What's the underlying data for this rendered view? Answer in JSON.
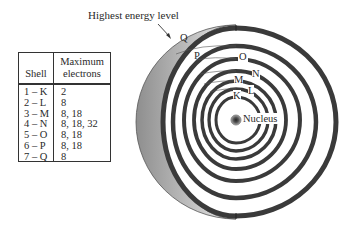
{
  "figure": {
    "caption_label": "Highest energy level",
    "nucleus_label": "Nucleus",
    "shell_labels": [
      "K",
      "L",
      "M",
      "N",
      "O",
      "P",
      "Q"
    ]
  },
  "table": {
    "headers": {
      "shell": "Shell",
      "max_line1": "Maximum",
      "max_line2": "electrons"
    },
    "rows": [
      {
        "shell": "1 – K",
        "max": "2"
      },
      {
        "shell": "2 – L",
        "max": "8"
      },
      {
        "shell": "3 – M",
        "max": "8, 18"
      },
      {
        "shell": "4 – N",
        "max": "8, 18, 32"
      },
      {
        "shell": "5 – O",
        "max": "8, 18"
      },
      {
        "shell": "6 – P",
        "max": "8, 18"
      },
      {
        "shell": "7 – Q",
        "max": "8"
      }
    ]
  },
  "colors": {
    "ring": "#3a3a3a",
    "crescent_dark": "#9a9a9a",
    "crescent_light": "#e6e6e6"
  }
}
